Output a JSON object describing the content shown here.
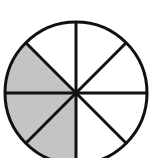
{
  "diagram": {
    "type": "fraction-circle",
    "total_sectors": 8,
    "shaded_sectors": 3,
    "shaded_fraction": "3/8",
    "center": [
      76,
      93
    ],
    "radius": 71,
    "shaded_start_angle_deg": 135,
    "shaded_end_angle_deg": 270,
    "colors": {
      "shade": "#c4c4c4",
      "stroke": "#111111",
      "background": "#ffffff"
    },
    "stroke_width": 3
  }
}
